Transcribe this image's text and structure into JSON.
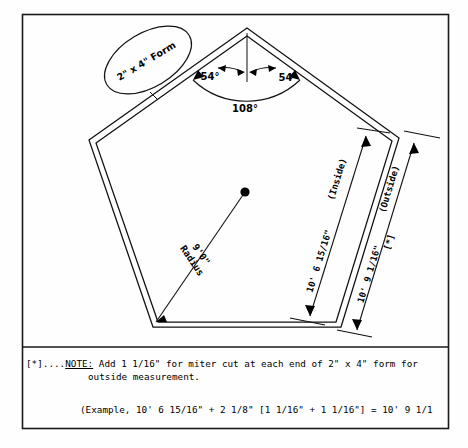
{
  "diagram": {
    "form_label": "2\" x 4\" Form",
    "radius_label_line1": "9'0\"",
    "radius_label_line2": "Radius",
    "angles": {
      "half_left": "54°",
      "half_right": "54°",
      "interior": "108°"
    },
    "dimensions": {
      "inside_value": "10' 6 15/16\"",
      "inside_caption": "(Inside)",
      "outside_value": "10' 9 1/16\"",
      "outside_caption": "(Outside)",
      "outside_marker": "[*]"
    }
  },
  "footnotes": {
    "note_marker": "[*]....",
    "note_word": "NOTE:",
    "note_text_line1": " Add 1 1/16\" for miter cut at each end of 2\" x 4\" form for",
    "note_text_line2": "outside measurement.",
    "example_line": "(Example, 10' 6 15/16\" + 2 1/8\" [1 1/16\" + 1 1/16\"] = 10' 9 1/1"
  },
  "colors": {
    "ink": "#111111",
    "paper": "#fefefe"
  }
}
